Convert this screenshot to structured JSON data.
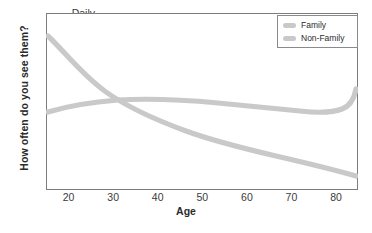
{
  "chart_data": {
    "type": "line",
    "title": "",
    "xlabel": "Age",
    "ylabel": "How often do you see them?",
    "xlim": [
      15,
      85
    ],
    "ylim": [
      0,
      100
    ],
    "grid": false,
    "xticks": [
      20,
      30,
      40,
      50,
      60,
      70,
      80
    ],
    "yticks": [
      "Never",
      "Daily"
    ],
    "ytick_top": "Daily",
    "ytick_bottom": "Never",
    "legend_position": "top-right",
    "series": [
      {
        "name": "Family",
        "color": "#c9c9c9",
        "x": [
          15,
          20,
          25,
          30,
          34,
          40,
          45,
          50,
          55,
          60,
          65,
          70,
          75,
          80,
          85
        ],
        "values": [
          87,
          76,
          65,
          56,
          51,
          44,
          40,
          36,
          33,
          30,
          27,
          24,
          20,
          16,
          12
        ]
      },
      {
        "name": "Non-Family",
        "color": "#c9c9c9",
        "x": [
          15,
          20,
          25,
          30,
          34,
          40,
          45,
          50,
          55,
          60,
          65,
          70,
          75,
          80,
          85
        ],
        "values": [
          43,
          47,
          50,
          51,
          51,
          50,
          49,
          48,
          47,
          46,
          45,
          45,
          47,
          52,
          58
        ]
      }
    ]
  },
  "axis": {
    "ytick_top": "Daily",
    "ytick_bottom": "Never",
    "ylabel": "How often do you see them?",
    "xlabel": "Age",
    "xticks": [
      {
        "label": "20",
        "pos": 68.6
      },
      {
        "label": "30",
        "pos": 113.2
      },
      {
        "label": "40",
        "pos": 157.7
      },
      {
        "label": "50",
        "pos": 202.3
      },
      {
        "label": "60",
        "pos": 246.9
      },
      {
        "label": "70",
        "pos": 291.4
      },
      {
        "label": "80",
        "pos": 336.0
      }
    ]
  },
  "legend": {
    "items": [
      {
        "label": "Family",
        "color": "#c9c9c9"
      },
      {
        "label": "Non-Family",
        "color": "#c9c9c9"
      }
    ]
  },
  "colors": {
    "frame": "#7d7d7d",
    "series": "#c9c9c9",
    "text": "#2b2b2b",
    "background": "#ffffff"
  },
  "paths": {
    "family": "M 2,23 C 18,38 36,62 60,79 C 84,96 110,107 140,118 C 170,129 200,136 230,143 C 256,149 282,155 310,163",
    "non_family": "M 2,99 C 22,93 46,89 72,87 C 108,85 140,87 172,90 C 204,93 232,96 254,98 C 272,100 286,100 296,96 C 304,93 308,87 310,76"
  }
}
